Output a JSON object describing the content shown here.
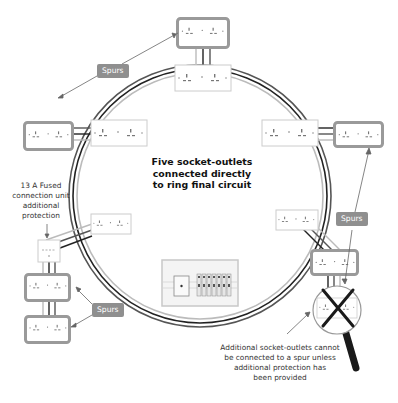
{
  "diagram": {
    "title": "Five socket-outlets connected directly to ring final circuit",
    "title_lines": [
      "Five socket-outlets",
      "connected directly",
      "to ring final circuit"
    ],
    "fcu_label_lines": [
      "13 A Fused",
      "connection unit",
      "additional",
      "protection"
    ],
    "note_lines": [
      "Additional socket-outlets cannot",
      "be connected to a spur unless",
      "additional protection has",
      "been provided"
    ],
    "spur_badges": [
      {
        "label": "Spurs",
        "x": 97,
        "y": 64
      },
      {
        "label": "Spurs",
        "x": 343,
        "y": 218
      },
      {
        "label": "Spurs",
        "x": 92,
        "y": 303
      }
    ],
    "components": {
      "ring_outlets": 5,
      "spur_outlets": 5,
      "consumer_unit": "Consumer unit",
      "fused_connection_unit": "13 A Fused connection unit",
      "magnifier": "crossed-out spur socket"
    },
    "colors": {
      "cable_dark": "#222222",
      "cable_grey": "#888888",
      "cable_light": "#bbbbbb",
      "socket_border_spur": "#9a9a9a",
      "socket_face": "#ffffff",
      "badge_bg": "#8f8f8f",
      "cross": "#1a1a1a"
    }
  }
}
